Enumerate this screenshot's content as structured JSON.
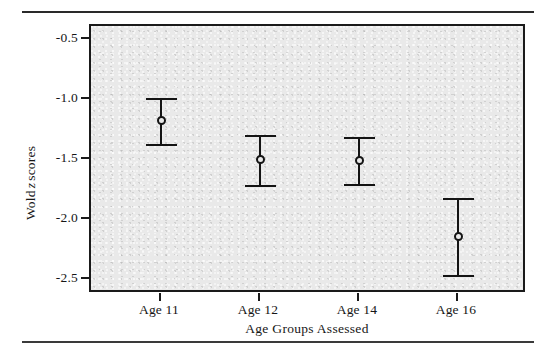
{
  "figure": {
    "rules": {
      "top": "horizontal-rule",
      "bottom": "horizontal-rule"
    }
  },
  "chart_data": {
    "type": "scatter",
    "title": "",
    "xlabel": "Age Groups Assessed",
    "ylabel": "Wold z scores",
    "ylabel_parts": {
      "prefix": "Wold",
      "italic": "z",
      "suffix": "scores"
    },
    "categories": [
      "Age 11",
      "Age 12",
      "Age 14",
      "Age 16"
    ],
    "values": [
      -1.15,
      -1.48,
      -1.49,
      -2.13
    ],
    "error_upper": [
      -0.96,
      -1.27,
      -1.29,
      -1.81
    ],
    "error_lower": [
      -1.35,
      -1.7,
      -1.69,
      -2.46
    ],
    "ylim": [
      -2.62,
      -0.35
    ],
    "yticks": [
      -0.5,
      -1.0,
      -1.5,
      -2.0,
      -2.5
    ],
    "ytick_labels": [
      "-0.5",
      "-1.0",
      "-1.5",
      "-2.0",
      "-2.5"
    ],
    "grid": false,
    "legend": null,
    "marker": "open-circle",
    "series": [
      {
        "name": "Wold z score",
        "points": [
          {
            "category": "Age 11",
            "value": -1.15,
            "upper": -0.96,
            "lower": -1.35
          },
          {
            "category": "Age 12",
            "value": -1.48,
            "upper": -1.27,
            "lower": -1.7
          },
          {
            "category": "Age 14",
            "value": -1.49,
            "upper": -1.29,
            "lower": -1.69
          },
          {
            "category": "Age 16",
            "value": -2.13,
            "upper": -1.81,
            "lower": -2.46
          }
        ]
      }
    ],
    "colors": {
      "panel_background": "#e9e9e9",
      "axis": "#1a1a1a",
      "marker": "#141414",
      "errorbar": "#141414"
    }
  }
}
